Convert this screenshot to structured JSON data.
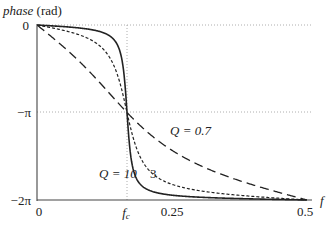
{
  "chart_data": {
    "type": "line",
    "title": "",
    "ylabel": "phase (rad)",
    "ylabel_italic_part": "phase",
    "ylabel_unit": "(rad)",
    "xlabel": "f",
    "xlim": [
      0,
      0.5
    ],
    "ylim": [
      -6.2832,
      0
    ],
    "x_ticks": [
      {
        "value": 0,
        "label": "0"
      },
      {
        "value": 0.1667,
        "label": "f_c",
        "italic": true,
        "display": "f",
        "sub": "c"
      },
      {
        "value": 0.25,
        "label": "0.25"
      },
      {
        "value": 0.5,
        "label": "0.5"
      }
    ],
    "y_ticks": [
      {
        "value": 0,
        "label": "0"
      },
      {
        "value": -3.1416,
        "label": "−π"
      },
      {
        "value": -6.2832,
        "label": "−2π"
      }
    ],
    "gridlines": [
      {
        "orientation": "horizontal",
        "value": 0,
        "style": "dotted"
      },
      {
        "orientation": "horizontal",
        "value": -3.1416,
        "style": "dotted"
      },
      {
        "orientation": "vertical",
        "value": 0.1667,
        "style": "dotted"
      }
    ],
    "center_frequency": 0.1667,
    "series": [
      {
        "name": "Q = 10",
        "Q": 10,
        "style": "solid",
        "x": [
          0,
          0.05,
          0.1,
          0.13,
          0.15,
          0.16,
          0.1667,
          0.175,
          0.19,
          0.22,
          0.3,
          0.4,
          0.5
        ],
        "values": [
          0,
          -0.04,
          -0.12,
          -0.3,
          -0.75,
          -1.6,
          -3.14,
          -4.9,
          -5.7,
          -6.0,
          -6.18,
          -6.24,
          -6.28
        ]
      },
      {
        "name": "3",
        "Q": 3,
        "style": "short-dash",
        "x": [
          0,
          0.05,
          0.1,
          0.13,
          0.15,
          0.1667,
          0.19,
          0.22,
          0.3,
          0.4,
          0.5
        ],
        "values": [
          0,
          -0.35,
          -0.9,
          -1.5,
          -2.2,
          -3.14,
          -4.2,
          -4.9,
          -5.6,
          -6.0,
          -6.28
        ]
      },
      {
        "name": "Q = 0.7",
        "Q": 0.7,
        "style": "long-dash",
        "x": [
          0,
          0.05,
          0.1,
          0.13,
          0.1667,
          0.22,
          0.3,
          0.4,
          0.5
        ],
        "values": [
          0,
          -0.9,
          -1.85,
          -2.45,
          -3.14,
          -3.95,
          -4.85,
          -5.7,
          -6.28
        ]
      }
    ],
    "annotations": [
      {
        "text": "Q = 0.7",
        "x": 0.235,
        "y": -3.75
      },
      {
        "text": "Q = 10",
        "x": 0.12,
        "y": -5.3
      },
      {
        "text": "3",
        "x": 0.195,
        "y": -5.3
      }
    ],
    "legend": "inline annotations",
    "grid": false
  },
  "labels": {
    "y_title_italic": "phase",
    "y_title_unit": " (rad)",
    "x_title": "f",
    "y0": "0",
    "y_minus_pi": "−π",
    "y_minus_2pi": "−2π",
    "x0": "0",
    "x_fc": "f",
    "x_fc_sub": "c",
    "x_025": "0.25",
    "x_05": "0.5",
    "ann_q07": "Q = 0.7",
    "ann_q10": "Q = 10",
    "ann_q3": "3"
  }
}
